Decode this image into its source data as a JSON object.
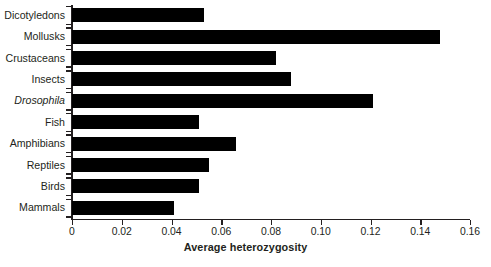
{
  "chart_data": {
    "type": "bar",
    "orientation": "horizontal",
    "title": "",
    "xlabel": "Average heterozygosity",
    "ylabel": "",
    "xlim": [
      0,
      0.16
    ],
    "grid": false,
    "legend": null,
    "bar_color": "#000000",
    "axis_color": "#231f20",
    "background": "#ffffff",
    "xticks": [
      0,
      0.02,
      0.04,
      0.06,
      0.08,
      0.1,
      0.12,
      0.14,
      0.16
    ],
    "xtick_labels": [
      "0",
      "0.02",
      "0.04",
      "0.06",
      "0.08",
      "0.10",
      "0.12",
      "0.14",
      "0.16"
    ],
    "categories": [
      "Dicotyledons",
      "Mollusks",
      "Crustaceans",
      "Insects",
      "Drosophila",
      "Fish",
      "Amphibians",
      "Reptiles",
      "Birds",
      "Mammals"
    ],
    "categories_italic": [
      false,
      false,
      false,
      false,
      true,
      false,
      false,
      false,
      false,
      false
    ],
    "values": [
      0.053,
      0.148,
      0.082,
      0.088,
      0.121,
      0.051,
      0.066,
      0.055,
      0.051,
      0.041
    ]
  }
}
